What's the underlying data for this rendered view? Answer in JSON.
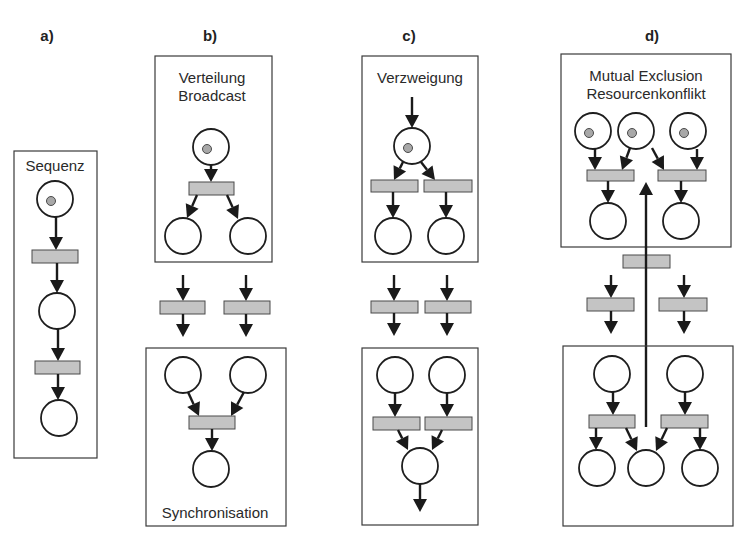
{
  "figure": {
    "type": "petri-net-patterns",
    "panels": [
      {
        "id": "a",
        "label": "a)",
        "titles": [
          "Sequenz"
        ],
        "pattern": "sequence",
        "places": 3,
        "tokens": 1,
        "transitions": 2
      },
      {
        "id": "b",
        "label": "b)",
        "titles": [
          "Verteilung",
          "Broadcast"
        ],
        "bottom_titles": [
          "Synchronisation"
        ],
        "pattern": "fork / join",
        "places": 6,
        "tokens": 1,
        "transitions": 4
      },
      {
        "id": "c",
        "label": "c)",
        "titles": [
          "Verzweigung"
        ],
        "pattern": "choice / merge",
        "places": 6,
        "tokens": 1,
        "transitions": 6
      },
      {
        "id": "d",
        "label": "d)",
        "titles": [
          "Mutual Exclusion",
          "Resourcenkonflikt"
        ],
        "pattern": "mutual exclusion",
        "places": 10,
        "tokens": 3,
        "transitions": 7
      }
    ],
    "colors": {
      "place_stroke": "#1e1e1e",
      "transition_fill": "#c4c4c4",
      "token_fill": "#a8a8a8",
      "arc": "#1a1a1a",
      "box_stroke": "#3a3a3a"
    }
  }
}
